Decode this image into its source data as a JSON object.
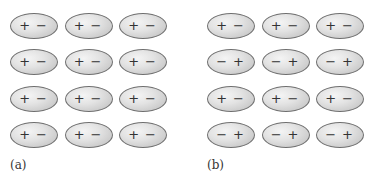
{
  "figure": {
    "panels": [
      {
        "label": "(a)",
        "rows": [
          [
            [
              "+",
              "−"
            ],
            [
              "+",
              "−"
            ],
            [
              "+",
              "−"
            ]
          ],
          [
            [
              "+",
              "−"
            ],
            [
              "+",
              "−"
            ],
            [
              "+",
              "−"
            ]
          ],
          [
            [
              "+",
              "−"
            ],
            [
              "+",
              "−"
            ],
            [
              "+",
              "−"
            ]
          ],
          [
            [
              "+",
              "−"
            ],
            [
              "+",
              "−"
            ],
            [
              "+",
              "−"
            ]
          ]
        ]
      },
      {
        "label": "(b)",
        "rows": [
          [
            [
              "+",
              "−"
            ],
            [
              "+",
              "−"
            ],
            [
              "+",
              "−"
            ]
          ],
          [
            [
              "−",
              "+"
            ],
            [
              "−",
              "+"
            ],
            [
              "−",
              "+"
            ]
          ],
          [
            [
              "+",
              "−"
            ],
            [
              "+",
              "−"
            ],
            [
              "+",
              "−"
            ]
          ],
          [
            [
              "−",
              "+"
            ],
            [
              "−",
              "+"
            ],
            [
              "−",
              "+"
            ]
          ]
        ]
      }
    ]
  }
}
